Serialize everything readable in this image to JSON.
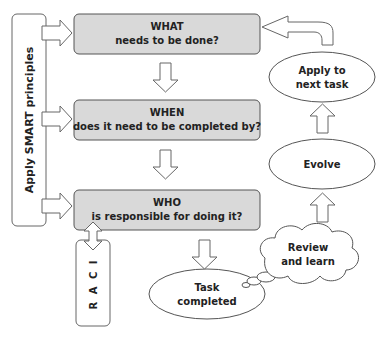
{
  "diagram": {
    "side_panel": {
      "label": "Apply SMART principles"
    },
    "raci": {
      "label": "R A C I"
    },
    "boxes": [
      {
        "title": "WHAT",
        "subtitle": "needs to be done?"
      },
      {
        "title": "WHEN",
        "subtitle": "does it need to be completed by?"
      },
      {
        "title": "WHO",
        "subtitle": "is responsible for doing it?"
      }
    ],
    "task_completed": {
      "line1": "Task",
      "line2": "completed"
    },
    "review": {
      "line1": "Review",
      "line2": "and learn"
    },
    "evolve": {
      "label": "Evolve"
    },
    "apply_next": {
      "line1": "Apply to",
      "line2": "next task"
    },
    "colors": {
      "box_fill": "#d9d9d9",
      "stroke": "#555555",
      "arrow_fill": "#ffffff"
    }
  }
}
